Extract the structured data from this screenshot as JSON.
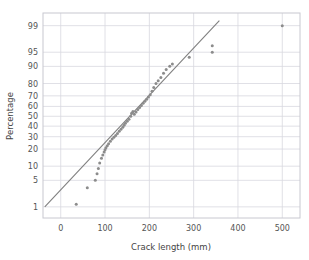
{
  "chart_data": {
    "type": "scatter",
    "title": "",
    "xlabel": "Crack length (mm)",
    "ylabel": "Percentage",
    "grid": true,
    "legend": null,
    "xlim": [
      -40,
      540
    ],
    "xticks": [
      0,
      100,
      200,
      300,
      400,
      500
    ],
    "xtick_labels": [
      "0",
      "100",
      "200",
      "300",
      "400",
      "500"
    ],
    "yscale": "probability",
    "ylim": [
      0.45,
      99.6
    ],
    "yticks": [
      1,
      5,
      10,
      20,
      30,
      40,
      50,
      60,
      70,
      80,
      90,
      95,
      99
    ],
    "ytick_labels": [
      "1",
      "5",
      "10",
      "20",
      "30",
      "40",
      "50",
      "60",
      "70",
      "80",
      "90",
      "95",
      "99"
    ],
    "marker_color": "#8c8c8c",
    "line_color": "#7f7f7f",
    "grid_color": "#d8d8e0",
    "frame_color": "#c8c8d0",
    "background": "#ffffff",
    "x": [
      35,
      60,
      78,
      82,
      85,
      88,
      92,
      95,
      98,
      100,
      102,
      105,
      108,
      112,
      116,
      120,
      124,
      128,
      132,
      136,
      140,
      143,
      146,
      150,
      154,
      158,
      160,
      163,
      166,
      170,
      174,
      178,
      182,
      186,
      190,
      194,
      198,
      202,
      206,
      210,
      215,
      220,
      226,
      232,
      238,
      246,
      252,
      290,
      342,
      342,
      500
    ],
    "y": [
      1.2,
      3.3,
      5.0,
      7.0,
      9.0,
      11.5,
      14.0,
      16.0,
      18.0,
      19.5,
      21.0,
      22.5,
      24.0,
      26.0,
      28.0,
      29.5,
      31.0,
      33.0,
      35.0,
      37.0,
      39.0,
      41.0,
      43.0,
      45.0,
      47.0,
      50.0,
      53.0,
      55.0,
      52.0,
      54.5,
      57.0,
      59.0,
      61.0,
      63.0,
      65.0,
      67.0,
      69.0,
      71.0,
      74.0,
      77.0,
      80.0,
      82.0,
      84.0,
      86.5,
      88.5,
      90.0,
      91.0,
      93.5,
      95.0,
      96.5,
      99.0
    ],
    "reference_line": {
      "x_start": -36,
      "y_start": 1.0,
      "x_end": 358,
      "y_end": 99.3
    }
  }
}
